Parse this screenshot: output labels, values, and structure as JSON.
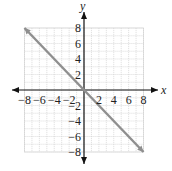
{
  "chart_data": {
    "type": "line",
    "title": "",
    "xlabel": "x",
    "ylabel": "y",
    "xlim": [
      -8,
      8
    ],
    "ylim": [
      -8,
      8
    ],
    "grid": true,
    "grid_step": 1,
    "x_ticks": [
      -8,
      -6,
      -4,
      -2,
      2,
      4,
      6,
      8
    ],
    "y_ticks": [
      8,
      6,
      4,
      2,
      -2,
      -4,
      -6,
      -8
    ],
    "x_tick_labels": [
      "−8",
      "−6",
      "−4",
      "−2",
      "2",
      "4",
      "6",
      "8"
    ],
    "y_tick_labels": [
      "8",
      "6",
      "4",
      "2",
      "−2",
      "−4",
      "−6",
      "−8"
    ],
    "series": [
      {
        "name": "y = -x",
        "points": [
          [
            -8,
            8
          ],
          [
            8,
            -8
          ]
        ],
        "color": "#8f8f8f"
      }
    ],
    "legend": null
  },
  "colors": {
    "grid": "#cfcfcf",
    "axis": "#111111",
    "line": "#8f8f8f"
  }
}
